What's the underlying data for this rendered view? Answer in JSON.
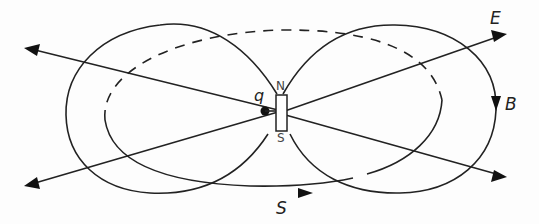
{
  "diagram": {
    "type": "field-lines",
    "labels": {
      "E": "E",
      "B": "B",
      "S": "S",
      "q": "q",
      "north": "N",
      "south": "S"
    },
    "elements": [
      {
        "name": "magnet",
        "description": "small bar magnet with N on top, S on bottom"
      },
      {
        "name": "charge",
        "description": "point charge q, left of magnet"
      },
      {
        "name": "E-field-lines",
        "description": "four radial straight arrows from q"
      },
      {
        "name": "B-field-loops",
        "description": "two lobe-shaped dipole field loops, arrow on right loop labelled B"
      },
      {
        "name": "S-loop",
        "description": "dashed/solid elliptical loop with arrow labelled S (Poynting vector circulation)"
      }
    ],
    "colors": {
      "stroke": "#222222",
      "background": "#fdfdfd"
    }
  }
}
